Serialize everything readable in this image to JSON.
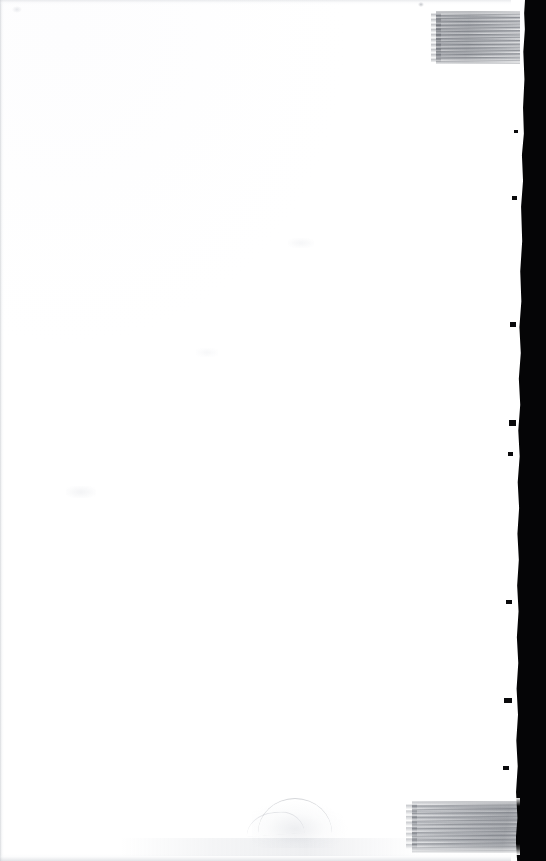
{
  "document": {
    "kind": "scanned-page",
    "page_background_color": "#ffffff",
    "scanner_void_color": "#050506",
    "page_width_px": 525,
    "page_height_px": 861,
    "canvas_width_px": 546,
    "canvas_height_px": 861,
    "visible_text": "",
    "caption": "Blank scanned page with pencil shading blocks at upper-right and lower-right and a dark scanner background strip along the right edge."
  },
  "marks": {
    "shade_blocks": [
      {
        "id": "shade-top",
        "name": "pencil-shading-block-top-right",
        "x": 436,
        "y": 11,
        "width": 84,
        "height": 53,
        "stroke_direction": "horizontal",
        "tone_color": "#7a7e86",
        "opacity_label": "medium"
      },
      {
        "id": "shade-bottom",
        "name": "pencil-shading-block-bottom-right",
        "x": 412,
        "y": 801,
        "width": 108,
        "height": 52,
        "stroke_direction": "horizontal",
        "tone_color": "#6c7078",
        "opacity_label": "medium"
      }
    ],
    "smudges": [
      {
        "id": "smudge-arc",
        "name": "graphite-smudge-arc",
        "x": 258,
        "y": 798,
        "width": 74,
        "height": 34,
        "tone_color": "#969aa2"
      },
      {
        "id": "smudge-arc-2",
        "name": "graphite-smudge-arc-secondary",
        "x": 246,
        "y": 812,
        "width": 58,
        "height": 22,
        "tone_color": "#b2b6be"
      },
      {
        "id": "smudge-haze",
        "name": "graphite-smudge-haze",
        "x": 252,
        "y": 800,
        "width": 96,
        "height": 48,
        "tone_color": "#c4c8d0"
      },
      {
        "id": "smudge-bottom-band",
        "name": "bottom-edge-shadow-band",
        "x": 120,
        "y": 838,
        "width": 300,
        "height": 18,
        "tone_color": "#cdd0d6"
      },
      {
        "id": "smudge-faint-left",
        "name": "paper-fleck-left",
        "x": 66,
        "y": 486,
        "width": 30,
        "height": 12,
        "tone_color": "#e2e4e8"
      },
      {
        "id": "smudge-faint-mid",
        "name": "paper-fleck-middle",
        "x": 288,
        "y": 238,
        "width": 26,
        "height": 10,
        "tone_color": "#e6e8ec"
      },
      {
        "id": "smudge-faint-top",
        "name": "paper-fleck-upper",
        "x": 196,
        "y": 348,
        "width": 22,
        "height": 9,
        "tone_color": "#e8eaee"
      },
      {
        "id": "smudge-speck-a",
        "name": "paper-speck-top",
        "x": 418,
        "y": 2,
        "width": 6,
        "height": 5,
        "tone_color": "#969aa2"
      },
      {
        "id": "smudge-speck-b",
        "name": "paper-speck-top-left",
        "x": 12,
        "y": 6,
        "width": 10,
        "height": 7,
        "tone_color": "#c8cbd2"
      }
    ]
  },
  "edges": {
    "right_void_width_px": 30,
    "page_right_boundary_px": 521,
    "left_edge_tone_color": "#babec4",
    "top_edge_tone_color": "#cdd0d6",
    "bottom_edge_tone_color": "#c6cad0",
    "edge_nicks": [
      {
        "name": "page-edge-nick-1",
        "x": 514,
        "y": 130,
        "width": 4,
        "height": 3
      },
      {
        "name": "page-edge-nick-2",
        "x": 512,
        "y": 196,
        "width": 5,
        "height": 4
      },
      {
        "name": "page-edge-nick-3",
        "x": 510,
        "y": 322,
        "width": 6,
        "height": 5
      },
      {
        "name": "page-edge-nick-4",
        "x": 509,
        "y": 420,
        "width": 7,
        "height": 6
      },
      {
        "name": "page-edge-nick-5",
        "x": 508,
        "y": 452,
        "width": 5,
        "height": 4
      },
      {
        "name": "page-edge-nick-6",
        "x": 506,
        "y": 600,
        "width": 6,
        "height": 4
      },
      {
        "name": "page-edge-nick-7",
        "x": 504,
        "y": 698,
        "width": 8,
        "height": 5
      },
      {
        "name": "page-edge-nick-8",
        "x": 503,
        "y": 766,
        "width": 6,
        "height": 4
      }
    ]
  }
}
